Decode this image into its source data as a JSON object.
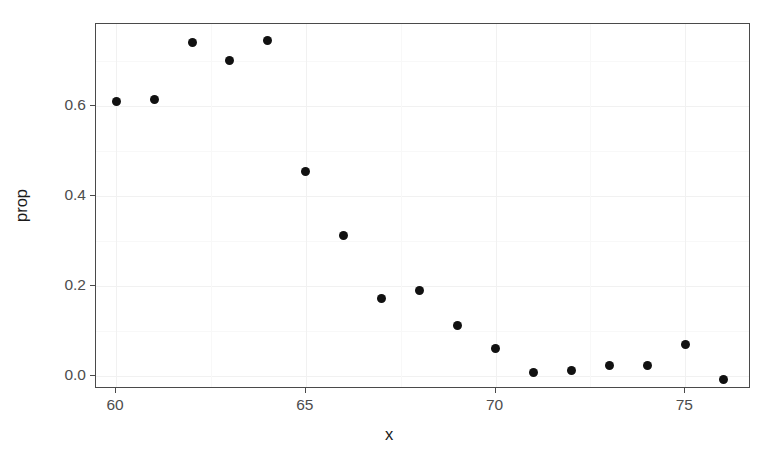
{
  "chart_data": {
    "type": "scatter",
    "title": "",
    "xlabel": "x",
    "ylabel": "prop",
    "xlim": [
      59.47,
      76.73
    ],
    "ylim": [
      -0.029,
      0.782
    ],
    "grid": true,
    "legend": null,
    "x": [
      60,
      61,
      62,
      63,
      64,
      65,
      66,
      67,
      68,
      69,
      70,
      71,
      72,
      73,
      74,
      75,
      76
    ],
    "values": [
      0.61,
      0.615,
      0.74,
      0.7,
      0.745,
      0.455,
      0.312,
      0.172,
      0.19,
      0.113,
      0.062,
      0.008,
      0.013,
      0.023,
      0.024,
      0.069,
      -0.007
    ],
    "points": [
      {
        "x": 60,
        "y": 0.61
      },
      {
        "x": 61,
        "y": 0.615
      },
      {
        "x": 62,
        "y": 0.74
      },
      {
        "x": 63,
        "y": 0.7
      },
      {
        "x": 64,
        "y": 0.745
      },
      {
        "x": 65,
        "y": 0.455
      },
      {
        "x": 66,
        "y": 0.312
      },
      {
        "x": 67,
        "y": 0.172
      },
      {
        "x": 68,
        "y": 0.19
      },
      {
        "x": 69,
        "y": 0.113
      },
      {
        "x": 70,
        "y": 0.062
      },
      {
        "x": 71,
        "y": 0.008
      },
      {
        "x": 72,
        "y": 0.013
      },
      {
        "x": 73,
        "y": 0.023
      },
      {
        "x": 74,
        "y": 0.024
      },
      {
        "x": 75,
        "y": 0.069
      },
      {
        "x": 76,
        "y": -0.007
      }
    ],
    "x_ticks": [
      60,
      65,
      70,
      75
    ],
    "x_tick_labels": [
      "60",
      "65",
      "70",
      "75"
    ],
    "y_ticks": [
      0.0,
      0.2,
      0.4,
      0.6
    ],
    "y_tick_labels": [
      "0.0",
      "0.2",
      "0.4",
      "0.6"
    ],
    "x_minor_ticks": [
      62.5,
      67.5,
      72.5
    ],
    "y_minor_ticks": [
      0.1,
      0.3,
      0.5,
      0.7
    ],
    "marker": {
      "shape": "circle",
      "color": "#111111",
      "size": 9
    },
    "colors": {
      "point": "#111111",
      "panel_border": "#4a4a4a",
      "grid_major": "#f1f1f1",
      "grid_minor": "#f8f8f8",
      "background": "#ffffff",
      "tick_label": "#4d4d4d",
      "axis_title": "#1a1a1a"
    }
  },
  "axes": {
    "x_title": "x",
    "y_title": "prop"
  }
}
